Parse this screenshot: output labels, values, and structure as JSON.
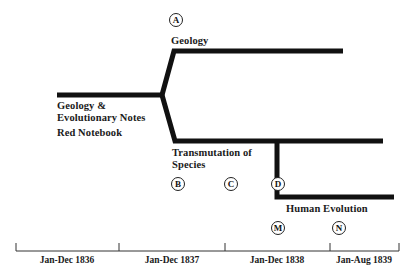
{
  "diagram": {
    "type": "branching-timeline",
    "trunk": {
      "labels": [
        "Geology &",
        "Evolutionary Notes"
      ],
      "sublabel": "Red Notebook"
    },
    "branches": [
      {
        "name": "Geology",
        "marker": "A"
      },
      {
        "name_lines": [
          "Transmutation of",
          "Species"
        ],
        "markers": [
          "B",
          "C",
          "D"
        ]
      },
      {
        "name": "Human Evolution",
        "markers": [
          "M",
          "N"
        ]
      }
    ],
    "axis": {
      "periods": [
        "Jan-Dec 1836",
        "Jan-Dec 1837",
        "Jan-Dec 1838",
        "Jan-Aug 1839"
      ]
    },
    "colors": {
      "line": "#111111",
      "background": "#ffffff"
    }
  }
}
